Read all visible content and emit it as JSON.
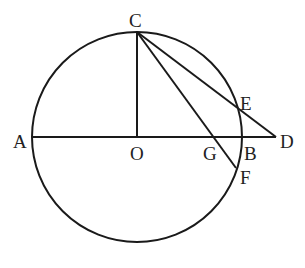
{
  "diagram": {
    "type": "geometry",
    "colors": {
      "stroke": "#1a1a1a",
      "background": "#ffffff",
      "label": "#222222"
    },
    "circle": {
      "center": "O",
      "cx": 137,
      "cy": 137,
      "r": 105
    },
    "points": {
      "A": {
        "label": "A",
        "x": 32,
        "y": 137
      },
      "B": {
        "label": "B",
        "x": 242,
        "y": 137
      },
      "C": {
        "label": "C",
        "x": 137,
        "y": 32
      },
      "D": {
        "label": "D",
        "x": 276,
        "y": 137
      },
      "E": {
        "label": "E",
        "x": 237,
        "y": 106
      },
      "F": {
        "label": "F",
        "x": 236,
        "y": 168
      },
      "G": {
        "label": "G",
        "x": 217,
        "y": 137
      },
      "O": {
        "label": "O",
        "x": 137,
        "y": 137
      }
    },
    "segments": [
      {
        "from": "A",
        "to": "D"
      },
      {
        "from": "C",
        "to": "O"
      },
      {
        "from": "C",
        "to": "D"
      },
      {
        "from": "C",
        "to": "F"
      }
    ]
  }
}
